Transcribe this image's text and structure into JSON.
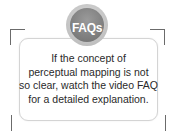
{
  "badge": {
    "label": "FAQs",
    "color": "#7a7a7a"
  },
  "message": {
    "lines": [
      "If the concept of",
      "perceptual mapping is not",
      "so clear, watch the video FAQ",
      "for a detailed explanation."
    ]
  }
}
